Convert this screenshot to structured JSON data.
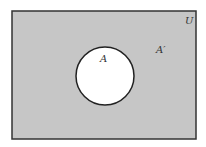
{
  "diagram": {
    "type": "venn",
    "title": "",
    "universe_label": "U",
    "set_label": "A",
    "complement_label": "A′",
    "colors": {
      "universe_fill": "#c6c6c6",
      "set_fill": "#ffffff",
      "stroke": "#222222"
    },
    "shaded_region": "A′"
  }
}
